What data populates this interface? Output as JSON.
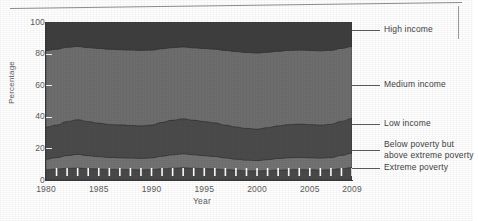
{
  "figure": {
    "ylabel": "Percentage",
    "xlabel": "Year"
  },
  "axes": {
    "y_ticks": [
      "100",
      "80",
      "60",
      "40",
      "20",
      "0"
    ],
    "x_ticks": [
      "1980",
      "1985",
      "1990",
      "1995",
      "2000",
      "2005",
      "2009"
    ]
  },
  "legend": {
    "items": [
      {
        "label": "High income"
      },
      {
        "label": "Medium income"
      },
      {
        "label": "Low income"
      },
      {
        "label": "Below poverty but\nabove extreme poverty"
      },
      {
        "label": "Extreme poverty"
      }
    ]
  },
  "colors": {
    "high_income": "#3f3f3f",
    "medium_income": "#6e6e6e",
    "low_income": "#4b4b4b",
    "below_poverty": "#737373",
    "extreme_poverty": "#4a4a4a",
    "axis": "#3a3a3a",
    "text": "#4a4a4a",
    "tick_mark": "#ffffff"
  },
  "chart_data": {
    "type": "area",
    "title": "",
    "xlabel": "Year",
    "ylabel": "Percentage",
    "xlim": [
      1980,
      2009
    ],
    "ylim": [
      0,
      100
    ],
    "grid": false,
    "legend_position": "right-leader-lines",
    "stacked": true,
    "stack_order": "bottom-to-top",
    "annotations": "White vertical tick marks mark each year inside the bottom (Extreme poverty) band.",
    "x": [
      1980,
      1981,
      1982,
      1983,
      1984,
      1985,
      1986,
      1987,
      1988,
      1989,
      1990,
      1991,
      1992,
      1993,
      1994,
      1995,
      1996,
      1997,
      1998,
      1999,
      2000,
      2001,
      2002,
      2003,
      2004,
      2005,
      2006,
      2007,
      2008,
      2009
    ],
    "series": [
      {
        "name": "Extreme poverty",
        "values": [
          6.5,
          7.0,
          7.4,
          7.6,
          7.2,
          7.0,
          6.8,
          6.7,
          6.6,
          6.5,
          6.6,
          7.1,
          7.5,
          7.8,
          7.5,
          7.2,
          7.0,
          6.6,
          6.2,
          5.9,
          5.8,
          6.0,
          6.3,
          6.5,
          6.6,
          6.5,
          6.4,
          6.5,
          7.2,
          7.9
        ]
      },
      {
        "name": "Below poverty but above extreme poverty",
        "values": [
          6.7,
          7.2,
          8.1,
          8.6,
          8.2,
          7.8,
          7.5,
          7.4,
          7.3,
          7.2,
          7.4,
          8.0,
          8.5,
          8.8,
          8.5,
          8.2,
          7.9,
          7.4,
          7.0,
          6.7,
          6.5,
          6.9,
          7.3,
          7.6,
          7.7,
          7.6,
          7.5,
          7.7,
          8.4,
          9.1
        ]
      },
      {
        "name": "Low income",
        "values": [
          20.3,
          20.6,
          21.5,
          22.0,
          21.6,
          21.2,
          20.9,
          20.8,
          20.7,
          20.6,
          20.8,
          21.4,
          21.9,
          22.2,
          21.9,
          21.6,
          21.3,
          20.8,
          20.4,
          20.1,
          19.9,
          20.3,
          20.7,
          21.0,
          21.1,
          21.0,
          20.9,
          21.1,
          21.6,
          22.0
        ]
      },
      {
        "name": "Medium income",
        "values": [
          48.5,
          48.0,
          47.0,
          46.3,
          46.8,
          47.3,
          47.6,
          47.6,
          47.7,
          47.8,
          47.4,
          46.6,
          45.9,
          45.4,
          45.8,
          46.2,
          46.6,
          47.2,
          47.7,
          48.0,
          48.2,
          47.7,
          47.2,
          46.9,
          46.8,
          46.9,
          47.0,
          46.8,
          46.1,
          45.5
        ]
      },
      {
        "name": "High income",
        "values": [
          18.0,
          17.2,
          16.0,
          15.5,
          16.2,
          16.7,
          17.2,
          17.5,
          17.7,
          17.9,
          17.8,
          16.9,
          16.2,
          15.8,
          16.3,
          16.8,
          17.2,
          18.0,
          18.7,
          19.3,
          19.6,
          19.1,
          18.5,
          18.0,
          17.8,
          18.0,
          18.2,
          17.9,
          16.7,
          15.5
        ]
      }
    ]
  }
}
